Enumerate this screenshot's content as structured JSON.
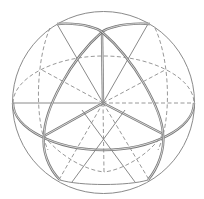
{
  "diagram": {
    "title": "",
    "colors": {
      "background": "#ffffff",
      "line": "#8a8a8a",
      "emphasis": "#777777"
    },
    "sphere": {
      "cx": 103.5,
      "cy": 102.5,
      "r": 91
    },
    "points": {
      "center": [
        103,
        103
      ],
      "top_vertex": [
        102,
        32
      ],
      "lower_left_vertex": [
        44,
        136
      ],
      "lower_right_vertex": [
        163,
        134
      ],
      "bottom_pole": [
        104,
        172
      ]
    },
    "labels": []
  }
}
